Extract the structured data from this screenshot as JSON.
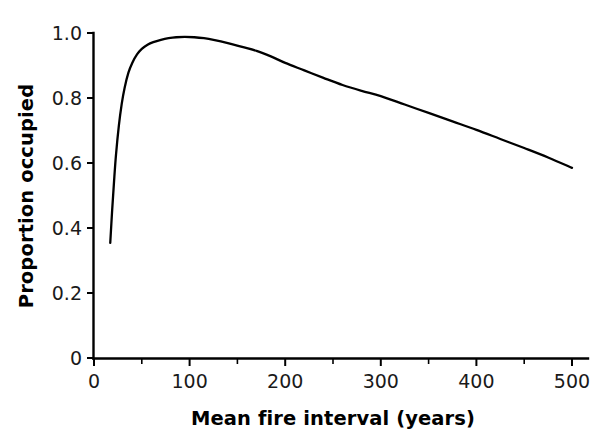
{
  "chart_data": {
    "type": "line",
    "title": "",
    "xlabel": "Mean fire interval (years)",
    "ylabel": "Proportion occupied",
    "xlim": [
      0,
      512
    ],
    "ylim": [
      0,
      1.02
    ],
    "grid": false,
    "legend": null,
    "x_ticks": [
      0,
      100,
      200,
      300,
      400,
      500
    ],
    "x_tick_labels": [
      "0",
      "100",
      "200",
      "300",
      "400",
      "500"
    ],
    "x_minor_ticks": [
      50,
      150,
      250,
      350,
      450
    ],
    "y_ticks": [
      0,
      0.2,
      0.4,
      0.6,
      0.8,
      1.0
    ],
    "y_tick_labels": [
      "0",
      "0.2",
      "0.4",
      "0.6",
      "0.8",
      "1.0"
    ],
    "series": [
      {
        "name": "Proportion occupied",
        "color": "#000000",
        "x": [
          17,
          19,
          21,
          23,
          26,
          29,
          32,
          36,
          40,
          45,
          50,
          56,
          62,
          70,
          78,
          86,
          95,
          105,
          115,
          125,
          140,
          155,
          170,
          185,
          200,
          220,
          240,
          260,
          280,
          300,
          325,
          350,
          375,
          400,
          425,
          450,
          475,
          500
        ],
        "y": [
          0.354,
          0.455,
          0.545,
          0.625,
          0.715,
          0.782,
          0.831,
          0.878,
          0.908,
          0.934,
          0.951,
          0.964,
          0.972,
          0.979,
          0.984,
          0.987,
          0.988,
          0.987,
          0.984,
          0.979,
          0.969,
          0.957,
          0.945,
          0.928,
          0.908,
          0.885,
          0.862,
          0.84,
          0.822,
          0.806,
          0.78,
          0.754,
          0.728,
          0.702,
          0.674,
          0.646,
          0.617,
          0.585
        ]
      }
    ],
    "annotations": {
      "peak_x": 95,
      "peak_y": 0.988,
      "start_x": 17,
      "start_y": 0.354,
      "end_x": 500,
      "end_y": 0.585
    }
  },
  "axes": {
    "y_axis_name": "proportion-occupied-axis",
    "x_axis_name": "mean-fire-interval-axis"
  }
}
